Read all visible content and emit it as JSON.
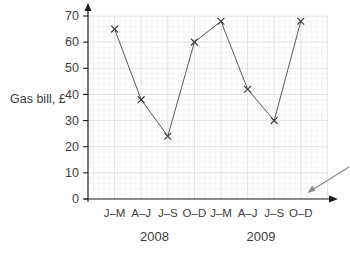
{
  "chart_data": {
    "type": "line",
    "title": "",
    "ylabel": "Gas bill, £",
    "xlabel": "",
    "categories": [
      "J–M",
      "A–J",
      "J–S",
      "O–D",
      "J–M",
      "A–J",
      "J–S",
      "O–D"
    ],
    "year_groups": [
      {
        "label": "2008",
        "start_index": 0,
        "end_index": 3
      },
      {
        "label": "2009",
        "start_index": 4,
        "end_index": 7
      }
    ],
    "series": [
      {
        "name": "Gas bill",
        "values": [
          65,
          38,
          24,
          60,
          68,
          42,
          30,
          68
        ]
      }
    ],
    "yticks": [
      0,
      10,
      20,
      30,
      40,
      50,
      60,
      70
    ],
    "ylim": [
      0,
      70
    ],
    "grid": "major+minor graph paper",
    "legend": "none",
    "marker": "x",
    "colors": {
      "line": "#5a5a5a",
      "marker": "#3a3a3a",
      "axis": "#1c1c1c",
      "text": "#3d3d3d",
      "grid_major": "#dcdcdc",
      "grid_minor": "#efefef",
      "annotation_arrow": "#8a8a8a"
    },
    "annotations": [
      {
        "type": "arrow",
        "description": "gray arrow pointing toward bottom-right corner of grid"
      }
    ]
  }
}
